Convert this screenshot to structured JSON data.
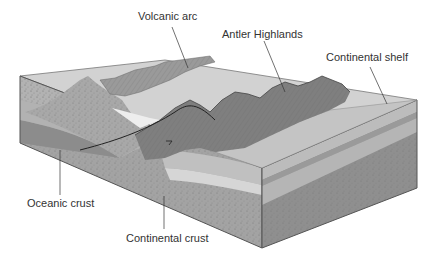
{
  "diagram": {
    "type": "geologic-block-diagram",
    "labels": {
      "volcanic_arc": "Volcanic arc",
      "antler_highlands": "Antler Highlands",
      "continental_shelf": "Continental shelf",
      "oceanic_crust": "Oceanic crust",
      "continental_crust": "Continental crust"
    },
    "colors": {
      "background": "#ffffff",
      "block_top": "#c9c9c9",
      "front_face": "#9c9c9c",
      "right_face": "#8e8e8e",
      "oceanic_crust": "#8a8a8a",
      "mountains": "#7d7d7d",
      "shelf_layers": "#b8b8b8",
      "outline": "#555555",
      "leader_lines": "#333333"
    }
  }
}
